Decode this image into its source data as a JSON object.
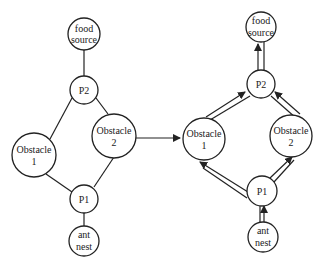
{
  "left": {
    "nodes": [
      {
        "id": "food",
        "lines": [
          "food",
          "source"
        ]
      },
      {
        "id": "p2",
        "lines": [
          "P2"
        ]
      },
      {
        "id": "obs1",
        "lines": [
          "Obstacle",
          "1"
        ]
      },
      {
        "id": "obs2",
        "lines": [
          "Obstacle",
          "2"
        ]
      },
      {
        "id": "p1",
        "lines": [
          "P1"
        ]
      },
      {
        "id": "nest",
        "lines": [
          "ant",
          "nest"
        ]
      }
    ]
  },
  "right": {
    "nodes": [
      {
        "id": "food",
        "lines": [
          "food",
          "source"
        ]
      },
      {
        "id": "p2",
        "lines": [
          "P2"
        ]
      },
      {
        "id": "obs1",
        "lines": [
          "Obstacle",
          "1"
        ]
      },
      {
        "id": "obs2",
        "lines": [
          "Obstacle",
          "2"
        ]
      },
      {
        "id": "p1",
        "lines": [
          "P1"
        ]
      },
      {
        "id": "nest",
        "lines": [
          "ant",
          "nest"
        ]
      }
    ]
  },
  "labels": {
    "l_food_1": "food",
    "l_food_2": "source",
    "l_p2": "P2",
    "l_obs1_1": "Obstacle",
    "l_obs1_2": "1",
    "l_obs2_1": "Obstacle",
    "l_obs2_2": "2",
    "l_p1": "P1",
    "l_nest_1": "ant",
    "l_nest_2": "nest",
    "r_food_1": "food",
    "r_food_2": "source",
    "r_p2": "P2",
    "r_obs1_1": "Obstacle",
    "r_obs1_2": "1",
    "r_obs2_1": "Obstacle",
    "r_obs2_2": "2",
    "r_p1": "P1",
    "r_nest_1": "ant",
    "r_nest_2": "nest"
  }
}
